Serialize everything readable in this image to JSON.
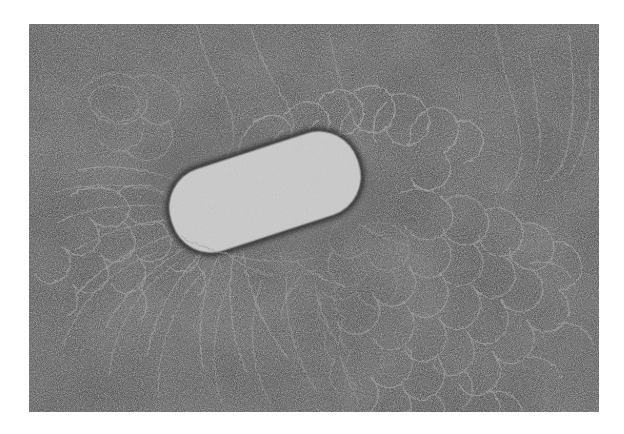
{
  "figure": {
    "kind": "transmission-electron-micrograph",
    "caption_text": "",
    "title_text": "",
    "label_text": "",
    "scale_bar_text": "",
    "has_visible_text": false,
    "page_background": "#ffffff",
    "plate": {
      "left": 29,
      "top": 24,
      "width": 570,
      "height": 388,
      "background_color": "#3b3b3b",
      "border": "none"
    },
    "tones": {
      "paper_white": "#ffffff",
      "background_dark": "#3a3a3a",
      "background_dark_2": "#303030",
      "background_light": "#4a4a4a",
      "grain_bright": "#9a9a9a",
      "filament_light": "#c9c9c9",
      "filament_mid": "#8f8f8f",
      "cell_bright": "#f2f2f2",
      "cell_white": "#fdfdfd",
      "cell_mid": "#b8b8b8",
      "cell_dark": "#2a2a2a",
      "shadow": "#1a1a1a"
    },
    "cell_body": {
      "name": "bacterial-cell",
      "center_x": 265,
      "center_y": 192,
      "length": 196,
      "width": 86,
      "rotation_deg": -18,
      "description": "rod shape, coarse bright granular interior with dark mottling and two large near-white blobs"
    },
    "regions": [
      {
        "name": "dense-dna-mass-lower-right",
        "x": 400,
        "y": 250,
        "width": 200,
        "height": 160,
        "density": "very-high"
      },
      {
        "name": "dna-halo-around-cell",
        "x": 150,
        "y": 110,
        "width": 300,
        "height": 200,
        "density": "high"
      },
      {
        "name": "sparse-loops-upper-left",
        "x": 40,
        "y": 40,
        "width": 180,
        "height": 140,
        "density": "low"
      },
      {
        "name": "radiating-strands-lower-left",
        "x": 40,
        "y": 230,
        "width": 200,
        "height": 170,
        "density": "medium"
      },
      {
        "name": "isolated-strands-upper-right",
        "x": 430,
        "y": 30,
        "width": 160,
        "height": 180,
        "density": "low"
      }
    ]
  }
}
